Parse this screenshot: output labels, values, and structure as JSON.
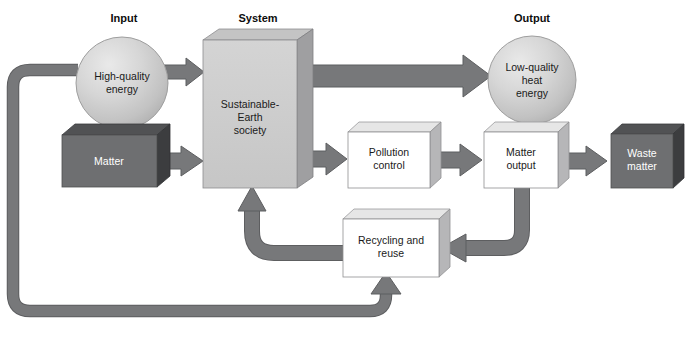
{
  "diagram": {
    "colors": {
      "arrow": "#77787a",
      "arrow_edge": "#5d5e60",
      "box_dark_face": "#6e6f71",
      "box_dark_top": "#4e4f51",
      "box_dark_side": "#3b3c3e",
      "box_light_face": "#cdcdcd",
      "box_light_top": "#bcbcbc",
      "box_light_side": "#9a9a9c",
      "box_white_face": "#ffffff",
      "box_white_top": "#e2e2e2",
      "box_white_side": "#b4b4b6",
      "circle_fill": "#c9c9c9",
      "circle_highlight": "#e6e6e6",
      "text_dark": "#1a1a1a",
      "text_light": "#ffffff",
      "background": "#ffffff"
    },
    "headers": [
      {
        "id": "input",
        "label": "Input",
        "x": 124,
        "y": 22
      },
      {
        "id": "system",
        "label": "System",
        "x": 258,
        "y": 22
      },
      {
        "id": "output",
        "label": "Output",
        "x": 532,
        "y": 22
      }
    ],
    "nodes": [
      {
        "id": "high-quality-energy",
        "label_lines": [
          "High-quality",
          "energy"
        ],
        "shape": "circle",
        "style": "gradient-sphere",
        "cx": 122,
        "cy": 83,
        "r": 46
      },
      {
        "id": "matter",
        "label_lines": [
          "Matter"
        ],
        "shape": "box3d",
        "style": "dark",
        "x": 62,
        "y": 135,
        "w": 95,
        "h": 52,
        "depth": 13
      },
      {
        "id": "sustainable-earth-society",
        "label_lines": [
          "Sustainable-",
          "Earth",
          "society"
        ],
        "shape": "box3d",
        "style": "light",
        "x": 203,
        "y": 40,
        "w": 94,
        "h": 148,
        "depth": 16
      },
      {
        "id": "low-quality-heat-energy",
        "label_lines": [
          "Low-quality",
          "heat",
          "energy"
        ],
        "shape": "circle",
        "style": "gradient-sphere",
        "cx": 532,
        "cy": 80,
        "r": 44
      },
      {
        "id": "pollution-control",
        "label_lines": [
          "Pollution",
          "control"
        ],
        "shape": "box3d",
        "style": "white",
        "x": 348,
        "y": 132,
        "w": 82,
        "h": 56,
        "depth": 11
      },
      {
        "id": "matter-output",
        "label_lines": [
          "Matter",
          "output"
        ],
        "shape": "box3d",
        "style": "white",
        "x": 484,
        "y": 132,
        "w": 74,
        "h": 56,
        "depth": 11
      },
      {
        "id": "waste-matter",
        "label_lines": [
          "Waste",
          "matter"
        ],
        "shape": "box3d",
        "style": "dark",
        "x": 611,
        "y": 134,
        "w": 62,
        "h": 54,
        "depth": 11
      },
      {
        "id": "recycling-and-reuse",
        "label_lines": [
          "Recycling and",
          "reuse"
        ],
        "shape": "box3d",
        "style": "white",
        "x": 343,
        "y": 219,
        "w": 96,
        "h": 58,
        "depth": 11
      }
    ],
    "connectors": [
      {
        "id": "energy-to-system",
        "from": "high-quality-energy",
        "to": "sustainable-earth-society",
        "kind": "straight-arrow-right"
      },
      {
        "id": "matter-to-system",
        "from": "matter",
        "to": "sustainable-earth-society",
        "kind": "straight-arrow-right"
      },
      {
        "id": "system-to-heat",
        "from": "sustainable-earth-society",
        "to": "low-quality-heat-energy",
        "kind": "straight-arrow-right"
      },
      {
        "id": "system-to-pollution-control",
        "from": "sustainable-earth-society",
        "to": "pollution-control",
        "kind": "straight-arrow-right"
      },
      {
        "id": "pollution-control-to-matter-output",
        "from": "pollution-control",
        "to": "matter-output",
        "kind": "straight-arrow-right"
      },
      {
        "id": "matter-output-to-waste-matter",
        "from": "matter-output",
        "to": "waste-matter",
        "kind": "straight-arrow-right"
      },
      {
        "id": "matter-output-to-recycling",
        "from": "matter-output",
        "to": "recycling-and-reuse",
        "kind": "curved-arrow-left"
      },
      {
        "id": "recycling-to-system",
        "from": "recycling-and-reuse",
        "to": "sustainable-earth-society",
        "kind": "curved-arrow-up"
      },
      {
        "id": "energy-feedback-loop",
        "from": "high-quality-energy",
        "to": "recycling-and-reuse",
        "kind": "loop-left-bottom-arrow-up"
      }
    ]
  }
}
